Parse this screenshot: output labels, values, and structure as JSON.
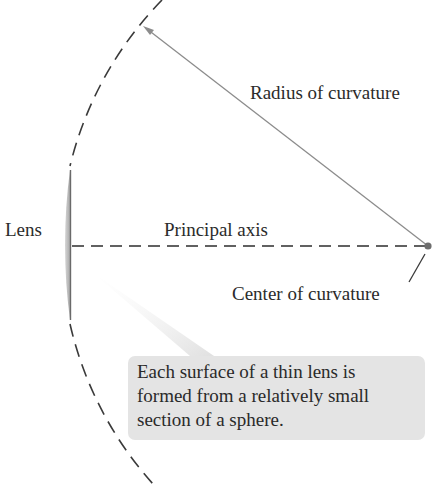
{
  "diagram": {
    "type": "thin-lens-geometry",
    "labels": {
      "lens": "Lens",
      "principal_axis": "Principal axis",
      "radius_of_curvature": "Radius of curvature",
      "center_of_curvature": "Center of curvature"
    },
    "callout": {
      "lines": [
        "Each surface of a thin lens is",
        "formed from a relatively small",
        "section of a sphere."
      ]
    },
    "colors": {
      "arc_dash": "#3a3a3a",
      "radius_line": "#8c8c8c",
      "axis_dash": "#2e2e2e",
      "center_dot": "#6e6e6e",
      "lens_fill": "#b8b8b8",
      "callout_bg": "#e4e4e4",
      "text": "#2a2a2a"
    },
    "geometry": {
      "center_of_curvature": [
        428,
        246
      ],
      "radius_px": 360
    }
  }
}
